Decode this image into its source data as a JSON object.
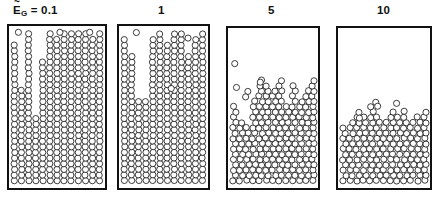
{
  "figure": {
    "type": "particle-simulation-snapshots",
    "symbol": {
      "base": "E",
      "accent": "~",
      "subscript": "G",
      "equals": "="
    }
  },
  "panels": [
    {
      "id": "panel-1",
      "label": "0.1",
      "label_full": "E_G = 0.1",
      "has_symbol_prefix": true,
      "state": "columnar-packed",
      "fill_fraction": 1.0,
      "box": {
        "x": 7,
        "y": 24,
        "w": 100,
        "h": 166
      },
      "columns": 13,
      "surface_profile": [
        0.93,
        0.62,
        0.99,
        0.46,
        0.8,
        0.99,
        0.97,
        0.99,
        0.99,
        0.98,
        0.99,
        0.95,
        0.99
      ]
    },
    {
      "id": "panel-2",
      "label": "1",
      "label_full": "1",
      "has_symbol_prefix": false,
      "state": "columnar-packed-disordered",
      "fill_fraction": 1.0,
      "box": {
        "x": 117,
        "y": 24,
        "w": 93,
        "h": 166
      },
      "columns": 12,
      "surface_profile": [
        0.97,
        0.84,
        0.55,
        0.57,
        0.95,
        0.99,
        0.92,
        0.99,
        0.99,
        0.86,
        0.97,
        0.99
      ]
    },
    {
      "id": "panel-3",
      "label": "5",
      "label_full": "5",
      "has_symbol_prefix": false,
      "state": "fluidized-rough-surface",
      "fill_fraction": 0.66,
      "box": {
        "x": 226,
        "y": 26,
        "w": 94,
        "h": 164
      },
      "columns": 13,
      "surface_profile": [
        0.52,
        0.44,
        0.4,
        0.57,
        0.72,
        0.66,
        0.62,
        0.7,
        0.55,
        0.68,
        0.58,
        0.63,
        0.72
      ]
    },
    {
      "id": "panel-4",
      "label": "10",
      "label_full": "10",
      "has_symbol_prefix": false,
      "state": "settled-dense-bed",
      "fill_fraction": 0.46,
      "box": {
        "x": 336,
        "y": 26,
        "w": 96,
        "h": 164
      },
      "columns": 13,
      "surface_profile": [
        0.4,
        0.44,
        0.5,
        0.46,
        0.52,
        0.47,
        0.43,
        0.49,
        0.45,
        0.48,
        0.44,
        0.46,
        0.5
      ]
    }
  ],
  "style": {
    "particle_fill": "#ffffff",
    "particle_stroke": "#111111",
    "border_color": "#111111",
    "background": "#ffffff",
    "particle_diameter_px": 6.4
  }
}
